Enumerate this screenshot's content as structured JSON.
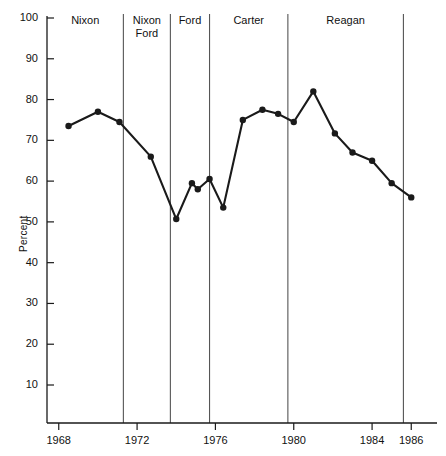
{
  "chart_data": {
    "type": "line",
    "title": "",
    "subtitle": "",
    "xlabel": "",
    "ylabel": "Percent",
    "xlim": [
      1967.4,
      1986.6
    ],
    "ylim": [
      0,
      100
    ],
    "grid": false,
    "legend": "none",
    "yticks": [
      10,
      20,
      30,
      40,
      50,
      60,
      70,
      80,
      90,
      100
    ],
    "ytick_labels": [
      "10",
      "20",
      "30",
      "40",
      "50",
      "60",
      "70",
      "80",
      "90",
      "100"
    ],
    "xticks": [
      1968,
      1972,
      1976,
      1980,
      1984,
      1986
    ],
    "xtick_labels": [
      "1968",
      "1972",
      "1976",
      "1980",
      "1984",
      "1986"
    ],
    "marker": "filled-circle",
    "line_color": "#1a1a1a",
    "marker_color": "#1a1a1a",
    "x": [
      1968.5,
      1970.0,
      1971.1,
      1972.7,
      1974.0,
      1974.8,
      1975.1,
      1975.7,
      1976.4,
      1977.4,
      1978.4,
      1979.2,
      1980.0,
      1981.0,
      1982.1,
      1983.0,
      1984.0,
      1985.0,
      1986.0
    ],
    "values": [
      73.5,
      77.0,
      74.5,
      66.0,
      50.7,
      59.5,
      58.0,
      60.5,
      53.5,
      75.0,
      77.5,
      76.5,
      74.5,
      82.0,
      71.7,
      67.0,
      65.0,
      59.5,
      56.0
    ],
    "annotations": [
      {
        "label": "Nixon",
        "x_start": 1967.4,
        "x_end": 1971.3
      },
      {
        "label": "Nixon\nFord",
        "x_start": 1971.3,
        "x_end": 1973.7
      },
      {
        "label": "Ford",
        "x_start": 1973.7,
        "x_end": 1975.7
      },
      {
        "label": "Carter",
        "x_start": 1975.7,
        "x_end": 1979.7
      },
      {
        "label": "Reagan",
        "x_start": 1979.7,
        "x_end": 1985.6
      }
    ],
    "divider_lines_x": [
      1971.3,
      1973.7,
      1975.7,
      1979.7,
      1985.6
    ]
  },
  "axis": {
    "y_label": "Percent",
    "y_ticks": [
      "100",
      "90",
      "80",
      "70",
      "60",
      "50",
      "40",
      "30",
      "20",
      "10"
    ],
    "x_ticks": [
      "1968",
      "1972",
      "1976",
      "1980",
      "1984",
      "1986"
    ]
  },
  "eras": {
    "nixon": "Nixon",
    "nixon_ford_line1": "Nixon",
    "nixon_ford_line2": "Ford",
    "ford": "Ford",
    "carter": "Carter",
    "reagan": "Reagan"
  },
  "colors": {
    "ink": "#1a1a1a",
    "divider": "#555555",
    "background": "#ffffff"
  }
}
